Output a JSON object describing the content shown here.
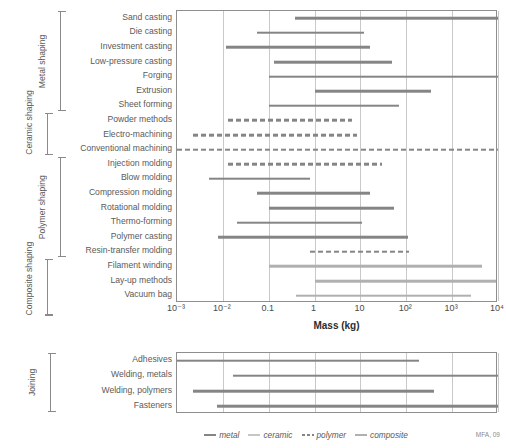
{
  "chart_data": {
    "type": "bar",
    "title": "",
    "xlabel": "Mass (kg)",
    "ylabel": "",
    "xscale": "log",
    "xlim": [
      0.001,
      10000
    ],
    "xticks": [
      "10-3",
      "10-2",
      "0.1",
      "1",
      "10",
      "10+2",
      "10+3",
      "10+4"
    ],
    "xtick_labels": [
      "10⁻³",
      "10⁻²",
      "0.1",
      "1",
      "10",
      "10²",
      "10³",
      "10⁴"
    ],
    "grid": true,
    "legend_position": "bottom",
    "credit": "MFA, 09",
    "panels": [
      {
        "name": "shaping",
        "groups": [
          {
            "label": "Metal shaping",
            "from": 0,
            "to": 7
          },
          {
            "label": "Ceramic shaping",
            "from": 7,
            "to": 10
          },
          {
            "label": "Polymer shaping",
            "from": 10,
            "to": 17
          },
          {
            "label": "Composite shaping",
            "from": 17,
            "to": 21
          }
        ],
        "rows": [
          {
            "label": "Sand casting",
            "material": "metal",
            "min": 0.37,
            "max": 10000
          },
          {
            "label": "Die casting",
            "material": "metal",
            "min": 0.055,
            "max": 12
          },
          {
            "label": "Investment casting",
            "material": "metal",
            "min": 0.012,
            "max": 16
          },
          {
            "label": "Low-pressure casting",
            "material": "metal",
            "min": 0.13,
            "max": 50
          },
          {
            "label": "Forging",
            "material": "metal",
            "min": 0.1,
            "max": 10000
          },
          {
            "label": "Extrusion",
            "material": "metal",
            "min": 1.0,
            "max": 350
          },
          {
            "label": "Sheet forming",
            "material": "metal",
            "min": 0.1,
            "max": 70
          },
          {
            "label": "Powder methods",
            "material": "polymer",
            "min": 0.013,
            "max": 6.5
          },
          {
            "label": "Electro-machining",
            "material": "polymer",
            "min": 0.0022,
            "max": 8.5
          },
          {
            "label": "Conventional machining",
            "material": "polymer",
            "min": 0.001,
            "max": 10000
          },
          {
            "label": "Injection molding",
            "material": "polymer",
            "min": 0.013,
            "max": 30
          },
          {
            "label": "Blow molding",
            "material": "metal",
            "min": 0.005,
            "max": 0.8
          },
          {
            "label": "Compression molding",
            "material": "metal",
            "min": 0.055,
            "max": 16
          },
          {
            "label": "Rotational molding",
            "material": "metal",
            "min": 0.1,
            "max": 55
          },
          {
            "label": "Thermo-forming",
            "material": "metal",
            "min": 0.02,
            "max": 11
          },
          {
            "label": "Polymer casting",
            "material": "metal",
            "min": 0.008,
            "max": 110
          },
          {
            "label": "Resin-transfer molding",
            "material": "polymer",
            "min": 0.8,
            "max": 115
          },
          {
            "label": "Filament winding",
            "material": "composite",
            "min": 0.1,
            "max": 4500
          },
          {
            "label": "Lay-up methods",
            "material": "composite",
            "min": 1.0,
            "max": 9000
          },
          {
            "label": "Vacuum bag",
            "material": "composite",
            "min": 0.4,
            "max": 2600
          }
        ]
      },
      {
        "name": "joining",
        "groups": [
          {
            "label": "Joining",
            "from": 0,
            "to": 4
          }
        ],
        "rows": [
          {
            "label": "Adhesives",
            "material": "metal",
            "min": 0.001,
            "max": 190
          },
          {
            "label": "Welding, metals",
            "material": "metal",
            "min": 0.017,
            "max": 10000
          },
          {
            "label": "Welding, polymers",
            "material": "metal",
            "min": 0.0022,
            "max": 410
          },
          {
            "label": "Fasteners",
            "material": "metal",
            "min": 0.0075,
            "max": 10000
          }
        ]
      }
    ],
    "legend": [
      {
        "label": "metal",
        "color": "#858585",
        "style": "solid"
      },
      {
        "label": "ceramic",
        "color": "#c6c6c6",
        "style": "solid"
      },
      {
        "label": "polymer",
        "color": "#858585",
        "style": "dashed"
      },
      {
        "label": "composite",
        "color": "#b0b0b0",
        "style": "solid"
      }
    ]
  }
}
